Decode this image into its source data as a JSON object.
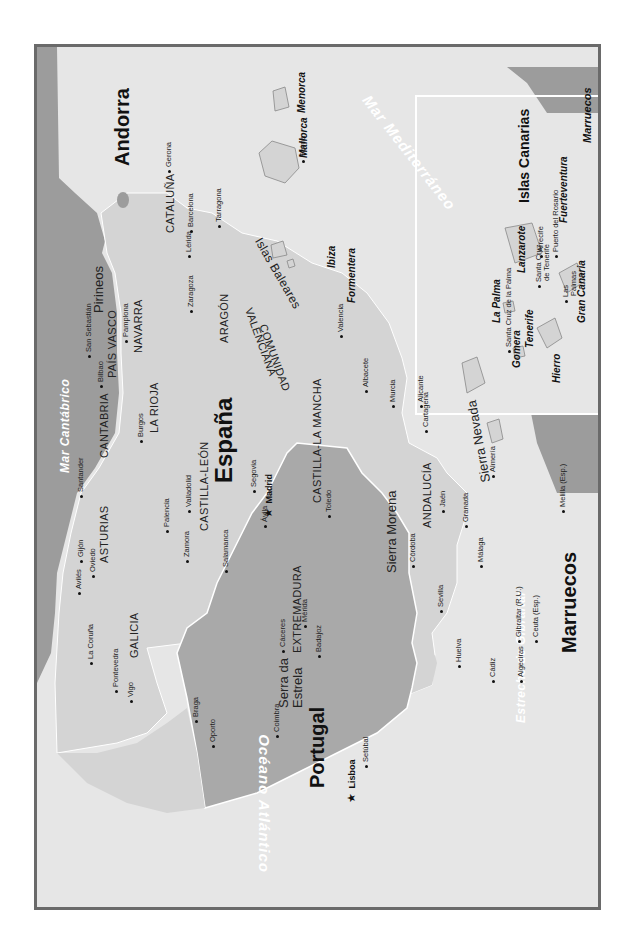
{
  "map": {
    "colors": {
      "frame_border": "#6a6a6a",
      "sea": "#e6e6e6",
      "spain_land": "#d4d4d4",
      "portugal_land": "#a9a9a9",
      "foreign_land": "#9c9c9c",
      "inset_border": "#ffffff",
      "sea_label": "#ffffff"
    },
    "countries": {
      "spain": "España",
      "portugal": "Portugal",
      "andorra": "Andorra",
      "marruecos": "Marruecos"
    },
    "capitals": {
      "madrid": "Madrid",
      "lisboa": "Lisboa"
    },
    "regions": {
      "galicia": "GALICIA",
      "asturias": "ASTURIAS",
      "cantabria": "CANTABRIA",
      "pais_vasco": "PAÍS VASCO",
      "navarra": "NAVARRA",
      "la_rioja": "LA RIOJA",
      "aragon": "ARAGÓN",
      "cataluna": "CATALUÑA",
      "castilla_leon": "CASTILLA-LEÓN",
      "castilla_la_mancha": "CASTILLA-LA MANCHA",
      "extremadura": "EXTREMADURA",
      "andalucia": "ANDALUCÍA",
      "comunidad_valenciana_1": "COMUNIDAD",
      "comunidad_valenciana_2": "VALENCIANA"
    },
    "mountains": {
      "pirineos": "Pirineos",
      "sierra_morena": "Sierra Morena",
      "sierra_nevada": "Sierra Nevada",
      "serra_estrela_1": "Serra da",
      "serra_estrela_2": "Estrela"
    },
    "seas": {
      "mar_cantabrico": "Mar Cantábrico",
      "mar_mediterraneo": "Mar Mediterráneo",
      "oceano_atlantico_west": "Océano Atlántico",
      "oceano_atlantico_canarias": "Océano Atlántico",
      "estrecho_gibraltar": "Estrecho de Gibraltar"
    },
    "cities": {
      "gijon": "Gijón",
      "oviedo": "Oviedo",
      "aviles": "Avilés",
      "la_coruna": "La Coruña",
      "pontevedra": "Pontevedra",
      "vigo": "Vigo",
      "santander": "Santander",
      "bilbao": "Bilbao",
      "san_sebastian": "San Sebastián",
      "pamplona": "Pamplona",
      "burgos": "Burgos",
      "palencia": "Palencia",
      "valladolid": "Valladolid",
      "zamora": "Zamora",
      "salamanca": "Salamanca",
      "segovia": "Segovia",
      "avila": "Ávila",
      "toledo": "Toledo",
      "caceres": "Cáceres",
      "merida": "Mérida",
      "badajoz": "Badajoz",
      "cordoba": "Córdoba",
      "sevilla": "Sevilla",
      "huelva": "Huelva",
      "cadiz": "Cádiz",
      "algeciras": "Algeciras",
      "gibraltar": "Gibraltar (R.U.)",
      "ceuta": "Ceuta (Esp.)",
      "melilla": "Melilla (Esp.)",
      "malaga": "Málaga",
      "granada": "Granada",
      "jaen": "Jaén",
      "almeria": "Almería",
      "murcia": "Murcia",
      "cartagena": "Cartagena",
      "alicante": "Alicante",
      "albacete": "Albacete",
      "valencia": "Valencia",
      "zaragoza": "Zaragoza",
      "lerida": "Lérida",
      "tarragona": "Tarragona",
      "barcelona": "Barcelona",
      "gerona": "Gerona",
      "palma": "Palma",
      "braga": "Braga",
      "oporto": "Oporto",
      "coimbra": "Coimbra",
      "setubal": "Setúbal"
    },
    "baleares": {
      "title": "Islas Baleares",
      "mallorca": "Mallorca",
      "menorca": "Menorca",
      "ibiza": "Ibiza",
      "formentera": "Formentera"
    },
    "canarias_inset": {
      "title": "Islas Canarias",
      "marruecos": "Marruecos",
      "islands": {
        "lanzarote": "Lanzarote",
        "fuerteventura": "Fuerteventura",
        "gran_canaria": "Gran Canaria",
        "tenerife": "Tenerife",
        "gomera": "Gomera",
        "hierro": "Hierro",
        "la_palma": "La Palma"
      },
      "cities": {
        "arrecife": "Arrecife",
        "puerto_rosario": "Puerto del Rosario",
        "las_palmas_1": "Las",
        "las_palmas_2": "Palmas",
        "santa_cruz_tenerife_1": "Santa Cruz",
        "santa_cruz_tenerife_2": "de Tenerife",
        "santa_cruz_palma": "Santa Cruz de la Palma"
      }
    }
  }
}
